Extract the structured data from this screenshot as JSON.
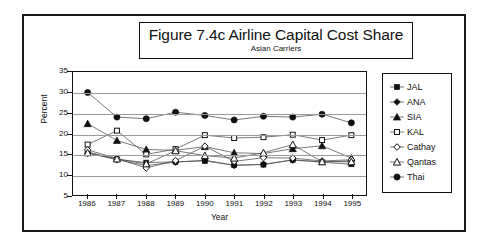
{
  "chart_data": {
    "type": "line",
    "title": "Figure 7.4c  Airline Capital Cost Share",
    "subtitle": "Asian Carriers",
    "xlabel": "Year",
    "ylabel": "Percent",
    "grid": true,
    "legend_position": "right",
    "ylim": [
      5,
      35
    ],
    "yticks": [
      5,
      10,
      15,
      20,
      25,
      30,
      35
    ],
    "categories": [
      "1986",
      "1987",
      "1988",
      "1989",
      "1990",
      "1991",
      "1992",
      "1993",
      "1994",
      "1995"
    ],
    "series": [
      {
        "name": "JAL",
        "marker": "filled-square",
        "values": [
          15.5,
          13.7,
          12.9,
          13.1,
          13.3,
          12.3,
          12.4,
          13.6,
          13.0,
          12.5
        ]
      },
      {
        "name": "ANA",
        "marker": "filled-diamond",
        "values": [
          15.2,
          13.6,
          12.2,
          13.0,
          13.5,
          12.2,
          12.5,
          13.5,
          13.1,
          13.3
        ]
      },
      {
        "name": "SIA",
        "marker": "filled-triangle",
        "values": [
          22.4,
          18.3,
          16.1,
          15.9,
          16.8,
          15.3,
          15.1,
          16.3,
          17.0,
          14.0
        ]
      },
      {
        "name": "KAL",
        "marker": "open-square",
        "values": [
          17.3,
          20.7,
          14.9,
          16.2,
          19.6,
          18.9,
          19.1,
          19.7,
          18.4,
          19.6
        ]
      },
      {
        "name": "Cathay",
        "marker": "open-diamond",
        "values": [
          16.0,
          13.9,
          11.6,
          13.4,
          16.9,
          13.2,
          14.1,
          14.0,
          13.3,
          13.6
        ]
      },
      {
        "name": "Qantas",
        "marker": "open-triangle",
        "values": [
          15.3,
          13.8,
          12.6,
          15.8,
          14.6,
          14.0,
          15.3,
          17.3,
          13.1,
          13.1
        ]
      },
      {
        "name": "Thai",
        "marker": "filled-circle",
        "values": [
          30.0,
          24.0,
          23.6,
          25.2,
          24.4,
          23.3,
          24.2,
          24.0,
          24.7,
          22.6
        ]
      }
    ]
  },
  "colors": {
    "frame": "#1a1a1a",
    "grid": "#9a9a9a",
    "ink": "#111111",
    "background": "#ffffff"
  }
}
